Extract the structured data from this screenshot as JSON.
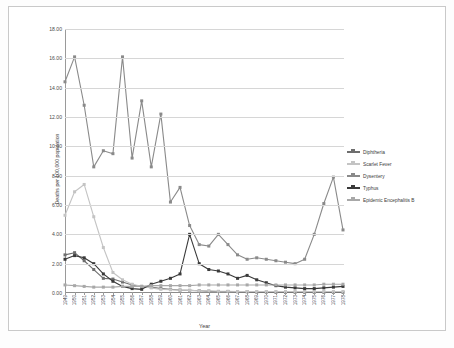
{
  "chart_data": {
    "type": "line",
    "title": "",
    "xlabel": "Year",
    "ylabel": "Deaths per 100,000 population",
    "ylim": [
      0,
      18
    ],
    "ytick_labels": [
      "0.00",
      "2.00",
      "4.00",
      "6.00",
      "8.00",
      "10.00",
      "12.00",
      "14.00",
      "16.00",
      "18.00"
    ],
    "ytick_values": [
      0,
      2,
      4,
      6,
      8,
      10,
      12,
      14,
      16,
      18
    ],
    "grid": true,
    "legend_position": "right",
    "categories": [
      "1949",
      "1950",
      "1951",
      "1952",
      "1953",
      "1954",
      "1955",
      "1956",
      "1957",
      "1958",
      "1959",
      "1960",
      "1961",
      "1962",
      "1963",
      "1964",
      "1965",
      "1966",
      "1967",
      "1968",
      "1969",
      "1970",
      "1971",
      "1972",
      "1973",
      "1974",
      "1975",
      "1976",
      "1977",
      "1978"
    ],
    "series": [
      {
        "name": "Diphtheria",
        "color": "#6e6e6e",
        "values": [
          2.6,
          2.75,
          2.2,
          1.6,
          1.0,
          0.95,
          0.75,
          0.55,
          0.45,
          0.4,
          0.3,
          0.25,
          0.2,
          0.18,
          0.15,
          0.12,
          0.1,
          0.1,
          0.08,
          0.08,
          0.06,
          0.06,
          0.05,
          0.05,
          0.05,
          0.05,
          0.05,
          0.05,
          0.05,
          0.05
        ]
      },
      {
        "name": "Scarlet Fever",
        "color": "#c4c4c4",
        "values": [
          5.3,
          6.9,
          7.4,
          5.2,
          3.1,
          1.4,
          0.9,
          0.6,
          0.45,
          0.35,
          0.25,
          0.22,
          0.2,
          0.18,
          0.15,
          0.15,
          0.12,
          0.12,
          0.1,
          0.1,
          0.1,
          0.1,
          0.1,
          0.1,
          0.1,
          0.1,
          0.1,
          0.1,
          0.1,
          0.1
        ]
      },
      {
        "name": "Dysentery",
        "color": "#8a8a8a",
        "values": [
          14.4,
          16.1,
          12.8,
          8.6,
          9.7,
          9.5,
          16.1,
          9.2,
          13.1,
          8.6,
          12.2,
          6.2,
          7.2,
          4.6,
          3.3,
          3.2,
          4.0,
          3.3,
          2.6,
          2.3,
          2.4,
          2.3,
          2.2,
          2.1,
          2.0,
          2.3,
          4.0,
          6.1,
          7.9,
          4.3
        ]
      },
      {
        "name": "Typhus",
        "color": "#3a3a3a",
        "values": [
          2.3,
          2.55,
          2.4,
          2.0,
          1.3,
          0.8,
          0.45,
          0.3,
          0.25,
          0.6,
          0.8,
          1.0,
          1.3,
          4.0,
          2.0,
          1.6,
          1.5,
          1.3,
          1.0,
          1.2,
          0.9,
          0.7,
          0.5,
          0.4,
          0.35,
          0.3,
          0.3,
          0.35,
          0.4,
          0.45
        ]
      },
      {
        "name": "Epidemic Encephalitis B",
        "color": "#a8a8a8",
        "values": [
          0.55,
          0.5,
          0.45,
          0.4,
          0.4,
          0.4,
          0.45,
          0.45,
          0.45,
          0.5,
          0.5,
          0.5,
          0.5,
          0.5,
          0.55,
          0.55,
          0.55,
          0.55,
          0.55,
          0.55,
          0.55,
          0.55,
          0.55,
          0.55,
          0.55,
          0.55,
          0.55,
          0.6,
          0.6,
          0.6
        ]
      }
    ]
  }
}
